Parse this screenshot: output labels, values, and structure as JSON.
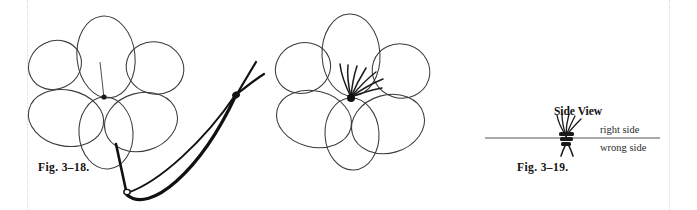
{
  "page": {
    "background_color": "#ffffff",
    "ink_color": "#111111",
    "margin_rule_color": "#d9d9d9"
  },
  "figures": [
    {
      "id": "fig-3-18",
      "caption": "Fig. 3–18.",
      "art_name": "five-petal-flower-with-thread-loop",
      "description_parts": [
        "five-petal-flower-outline",
        "thread-knot",
        "thread-loop"
      ]
    },
    {
      "id": "fig-3-19",
      "caption": "Fig. 3–19.",
      "art_name": "five-petal-flower-with-stamens",
      "description_parts": [
        "five-petal-flower-outline",
        "stamen-fan",
        "center-knot"
      ]
    },
    {
      "id": "fig-3-20",
      "caption": "Fig. 3–20.",
      "art_name": "side-view-fabric-cross-section",
      "title": "Side View",
      "labels": {
        "above_line": "right side",
        "below_line": "wrong side"
      }
    }
  ]
}
